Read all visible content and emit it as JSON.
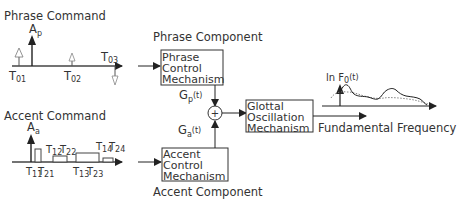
{
  "phrase_command": {
    "title": "Phrase Command",
    "amplitude_label": "A",
    "amplitude_sub": "p",
    "times": [
      {
        "label": "T",
        "sub": "01"
      },
      {
        "label": "T",
        "sub": "02"
      },
      {
        "label": "T",
        "sub": "03"
      }
    ]
  },
  "accent_command": {
    "title": "Accent Command",
    "amplitude_label": "A",
    "amplitude_sub": "a",
    "times": [
      {
        "label": "T",
        "sub": "11"
      },
      {
        "label": "T",
        "sub": "21"
      },
      {
        "label": "T",
        "sub": "12"
      },
      {
        "label": "T",
        "sub": "22"
      },
      {
        "label": "T",
        "sub": "13"
      },
      {
        "label": "T",
        "sub": "23"
      },
      {
        "label": "T",
        "sub": "14"
      },
      {
        "label": "T",
        "sub": "24"
      }
    ]
  },
  "phrase_component": {
    "title": "Phrase Component",
    "box_lines": [
      "Phrase",
      "Control",
      "Mechanism"
    ],
    "output_label": "G",
    "output_sub": "p",
    "output_suffix": "(t)"
  },
  "accent_component": {
    "title": "Accent Component",
    "box_lines": [
      "Accent",
      "Control",
      "Mechanism"
    ],
    "output_label": "G",
    "output_sub": "a",
    "output_suffix": "(t)"
  },
  "sum_node": {
    "symbol": "+"
  },
  "glottal": {
    "box_lines": [
      "Glottal",
      "Oscillation",
      "Mechanism"
    ]
  },
  "output": {
    "label": "Fundamental Frequency",
    "plot_label": "ln F",
    "plot_sub": "0",
    "plot_suffix": "(t)"
  }
}
